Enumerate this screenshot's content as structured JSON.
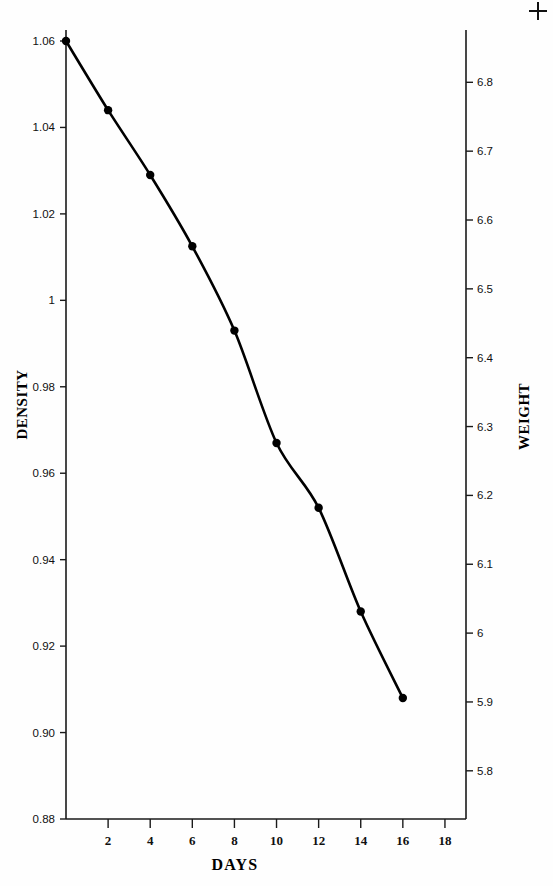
{
  "chart_data": {
    "type": "line",
    "title": "",
    "xlabel": "DAYS",
    "ylabel": "DENSITY",
    "ylabel_right": "WEIGHT",
    "x": [
      0,
      2,
      4,
      6,
      8,
      10,
      12,
      14,
      16
    ],
    "values": [
      1.06,
      1.044,
      1.029,
      1.0125,
      0.993,
      0.967,
      0.952,
      0.928,
      0.908
    ],
    "series": [
      {
        "name": "DENSITY",
        "values": [
          1.06,
          1.044,
          1.029,
          1.0125,
          0.993,
          0.967,
          0.952,
          0.928,
          0.908
        ]
      },
      {
        "name": "WEIGHT",
        "values": [
          6.83,
          6.74,
          6.65,
          6.56,
          6.45,
          6.3,
          6.22,
          6.08,
          5.97
        ]
      }
    ],
    "xlim": [
      0,
      19
    ],
    "ylim": [
      0.88,
      1.06
    ],
    "ylim_right": [
      5.73,
      6.86
    ],
    "xticks": [
      2,
      4,
      6,
      8,
      10,
      12,
      14,
      16,
      18
    ],
    "xticklabels": [
      "2",
      "4",
      "6",
      "8",
      "10",
      "12",
      "14",
      "16",
      "18"
    ],
    "yticks": [
      0.88,
      0.9,
      0.92,
      0.94,
      0.96,
      0.98,
      1.0,
      1.02,
      1.04,
      1.06
    ],
    "yticklabels": [
      "0.88",
      "0.90",
      "0.92",
      "0.94",
      "0.96",
      "0.98",
      "1",
      "1.02",
      "1.04",
      "1.06"
    ],
    "yticks_right": [
      5.8,
      5.9,
      6.0,
      6.1,
      6.2,
      6.3,
      6.4,
      6.5,
      6.6,
      6.7,
      6.8
    ],
    "yticklabels_right": [
      "5.8",
      "5.9",
      "6",
      "6.1",
      "6.2",
      "6.3",
      "6.4",
      "6.5",
      "6.6",
      "6.7",
      "6.8"
    ],
    "grid": false,
    "legend": "none",
    "marker": "filled-circle",
    "line_color": "#000000",
    "marker_color": "#000000",
    "axis_color": "#1a1a1a"
  },
  "labels": {
    "x_axis_title": "DAYS",
    "y_axis_title_left": "DENSITY",
    "y_axis_title_right": "WEIGHT"
  },
  "marks": {
    "registration": "plus-mark"
  }
}
